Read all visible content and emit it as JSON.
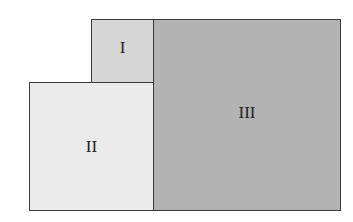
{
  "diagram": {
    "regions": [
      {
        "id": "I",
        "label": "I",
        "fill": "#d6d6d6"
      },
      {
        "id": "II",
        "label": "II",
        "fill": "#ebebeb"
      },
      {
        "id": "III",
        "label": "III",
        "fill": "#b3b3b3"
      }
    ],
    "border_color": "#3a3a3a"
  }
}
